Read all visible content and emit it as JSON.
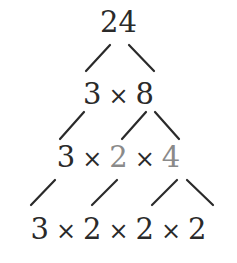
{
  "diagram": {
    "type": "factor-tree",
    "root": "24",
    "levels": [
      {
        "terms": [
          "24"
        ],
        "highlighted": []
      },
      {
        "terms": [
          "3",
          "8"
        ],
        "highlighted": []
      },
      {
        "terms": [
          "3",
          "2",
          "4"
        ],
        "highlighted": [
          1,
          2
        ]
      },
      {
        "terms": [
          "3",
          "2",
          "2",
          "2"
        ],
        "highlighted": []
      }
    ],
    "operator": "×",
    "colors": {
      "text": "#2a2a2a",
      "highlight": "#8a8a8a",
      "lines": "#2a2a2a"
    }
  }
}
